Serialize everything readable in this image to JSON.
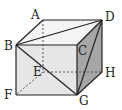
{
  "diagram": {
    "type": "cube",
    "labels": {
      "A": "A",
      "B": "B",
      "C": "C",
      "D": "D",
      "E": "E",
      "F": "F",
      "G": "G",
      "H": "H"
    },
    "vertices": {
      "A": [
        43,
        20
      ],
      "D": [
        102,
        20
      ],
      "B": [
        16,
        45
      ],
      "C": [
        77,
        45
      ],
      "E": [
        43,
        72
      ],
      "H": [
        102,
        72
      ],
      "F": [
        16,
        95
      ],
      "G": [
        77,
        95
      ]
    },
    "solid_segments": [
      [
        "A",
        "D"
      ],
      [
        "A",
        "B"
      ],
      [
        "B",
        "C"
      ],
      [
        "C",
        "D"
      ],
      [
        "B",
        "F"
      ],
      [
        "F",
        "G"
      ],
      [
        "C",
        "G"
      ],
      [
        "D",
        "H"
      ],
      [
        "H",
        "G"
      ],
      [
        "B",
        "D"
      ],
      [
        "B",
        "G"
      ],
      [
        "D",
        "G"
      ]
    ],
    "dashed_segments": [
      [
        "A",
        "E"
      ],
      [
        "E",
        "H"
      ],
      [
        "E",
        "F"
      ]
    ],
    "colors": {
      "top_face": "#f4f4f4",
      "front_face": "#e6e6e6",
      "right_face": "#a6a6a6",
      "edge": "#222222"
    }
  }
}
